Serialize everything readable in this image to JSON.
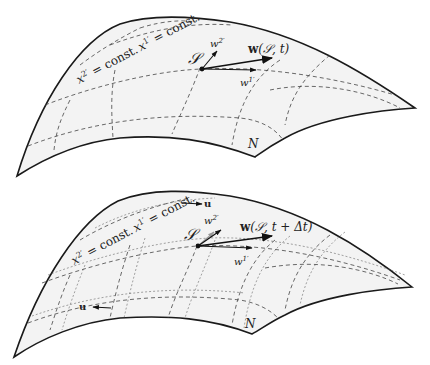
{
  "panels": [
    {
      "id": "top",
      "labels": {
        "point": "S",
        "vector": "w(S, t)",
        "w2": "w2'",
        "w1": "w1'",
        "grid_label": "x2' = const. x1' = const.",
        "region": "N"
      }
    },
    {
      "id": "bottom",
      "labels": {
        "point": "S",
        "vector": "w(S, t + Δt)",
        "w2": "w2'",
        "w1": "w1'",
        "grid_label": "x2' = const. x1' = const.",
        "region": "N",
        "flow_top": "u",
        "flow_bottom": "u"
      }
    }
  ],
  "text": {
    "top_point": "𝒮",
    "top_vec_w": "w",
    "top_vec_args": "(𝒮, t)",
    "top_w2_base": "w",
    "top_w2_sup": "2′",
    "top_w1_base": "w",
    "top_w1_sup": "1′",
    "top_x2": "x",
    "top_x2_sup": "2′",
    "top_eq1": " = const.",
    "top_x1": "x",
    "top_x1_sup": "1′",
    "top_eq2": " = const.",
    "top_N": "N",
    "bot_point": "𝒮",
    "bot_vec_w": "w",
    "bot_vec_args": "(𝒮, t + Δt)",
    "bot_w2_base": "w",
    "bot_w2_sup": "2′",
    "bot_w1_base": "w",
    "bot_w1_sup": "1′",
    "bot_x2": "x",
    "bot_x2_sup": "2′",
    "bot_eq1": " = const.",
    "bot_x1": "x",
    "bot_x1_sup": "1′",
    "bot_eq2": " = const.",
    "bot_N": "N",
    "bot_u_top": "u",
    "bot_u_bottom": "u"
  }
}
